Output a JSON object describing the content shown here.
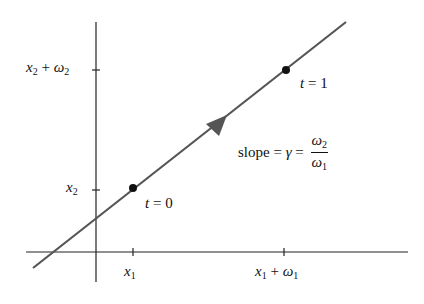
{
  "diagram": {
    "title": "",
    "axes": {
      "y_ticks": [
        {
          "var": "x",
          "sub": "2",
          "suffix_var": "ω",
          "suffix_sub": "2",
          "op": "+"
        },
        {
          "var": "x",
          "sub": "2"
        }
      ],
      "x_ticks": [
        {
          "var": "x",
          "sub": "1"
        },
        {
          "var": "x",
          "sub": "1",
          "op": "+",
          "suffix_var": "ω",
          "suffix_sub": "1"
        }
      ]
    },
    "points": [
      {
        "label_var": "t",
        "label_eq": " = 0"
      },
      {
        "label_var": "t",
        "label_eq": " = 1"
      }
    ],
    "slope_label": {
      "prefix": "slope = ",
      "gamma": "γ",
      "eq": " = ",
      "num_var": "ω",
      "num_sub": "2",
      "den_var": "ω",
      "den_sub": "1"
    },
    "colors": {
      "line": "#555555",
      "axes": "#222222",
      "point": "#111111",
      "text": "#111111"
    }
  }
}
